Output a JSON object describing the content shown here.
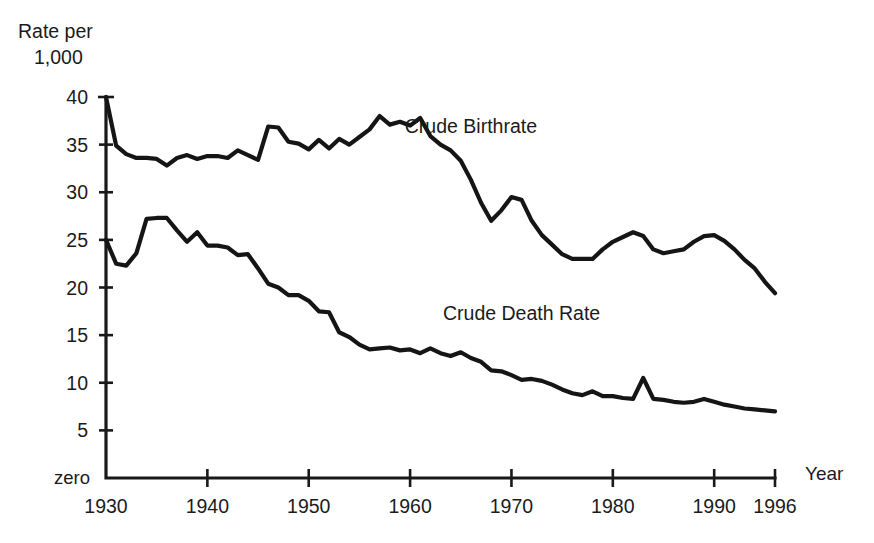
{
  "chart_data": {
    "type": "line",
    "title": "",
    "subtitle": "",
    "ylabel_line1": "Rate per",
    "ylabel_line2": "1,000",
    "xlabel": "Year",
    "zero_label": "zero",
    "grid": false,
    "legend_position": "inline-annotation",
    "xlim": [
      1930,
      1996
    ],
    "ylim": [
      0,
      40
    ],
    "yticks": [
      40,
      35,
      30,
      25,
      20,
      15,
      10,
      5
    ],
    "ytick_labels": [
      "40",
      "35",
      "30",
      "25",
      "20",
      "15",
      "10",
      "5"
    ],
    "xticks": [
      1930,
      1940,
      1950,
      1960,
      1970,
      1980,
      1990,
      1996
    ],
    "xtick_labels": [
      "1930",
      "1940",
      "1950",
      "1960",
      "1970",
      "1980",
      "1990",
      "1996"
    ],
    "x": [
      1930,
      1931,
      1932,
      1933,
      1934,
      1935,
      1936,
      1937,
      1938,
      1939,
      1940,
      1941,
      1942,
      1943,
      1944,
      1945,
      1946,
      1947,
      1948,
      1949,
      1950,
      1951,
      1952,
      1953,
      1954,
      1955,
      1956,
      1957,
      1958,
      1959,
      1960,
      1961,
      1962,
      1963,
      1964,
      1965,
      1966,
      1967,
      1968,
      1969,
      1970,
      1971,
      1972,
      1973,
      1974,
      1975,
      1976,
      1977,
      1978,
      1979,
      1980,
      1981,
      1982,
      1983,
      1984,
      1985,
      1986,
      1987,
      1988,
      1989,
      1990,
      1991,
      1992,
      1993,
      1994,
      1995,
      1996
    ],
    "series": [
      {
        "name": "Crude Birthrate",
        "label": "Crude Birthrate",
        "label_x": 1966,
        "label_y": 36.2,
        "color": "#151515",
        "values": [
          40.0,
          34.9,
          34.0,
          33.6,
          33.6,
          33.5,
          32.8,
          33.6,
          33.9,
          33.5,
          33.8,
          33.8,
          33.6,
          34.4,
          33.9,
          33.4,
          36.9,
          36.8,
          35.3,
          35.1,
          34.5,
          35.5,
          34.6,
          35.6,
          35.0,
          35.8,
          36.6,
          38.0,
          37.1,
          37.4,
          37.0,
          37.8,
          35.9,
          35.0,
          34.4,
          33.3,
          31.3,
          28.9,
          27.0,
          28.1,
          29.5,
          29.2,
          27.0,
          25.5,
          24.5,
          23.5,
          23.0,
          23.0,
          23.0,
          24.0,
          24.8,
          25.3,
          25.8,
          25.4,
          24.0,
          23.6,
          23.8,
          24.0,
          24.8,
          25.4,
          25.5,
          24.9,
          24.0,
          22.9,
          22.0,
          20.6,
          19.4
        ]
      },
      {
        "name": "Crude Death Rate",
        "label": "Crude Death Rate",
        "label_x": 1971,
        "label_y": 16.6,
        "color": "#151515",
        "values": [
          25.0,
          22.5,
          22.3,
          23.6,
          27.2,
          27.3,
          27.3,
          26.0,
          24.8,
          25.8,
          24.4,
          24.4,
          24.2,
          23.4,
          23.5,
          22.0,
          20.4,
          20.0,
          19.2,
          19.2,
          18.6,
          17.5,
          17.4,
          15.3,
          14.8,
          14.0,
          13.5,
          13.6,
          13.7,
          13.4,
          13.5,
          13.1,
          13.6,
          13.1,
          12.8,
          13.2,
          12.6,
          12.2,
          11.3,
          11.2,
          10.8,
          10.3,
          10.4,
          10.2,
          9.8,
          9.3,
          8.9,
          8.7,
          9.1,
          8.6,
          8.6,
          8.4,
          8.3,
          10.5,
          8.3,
          8.2,
          8.0,
          7.9,
          8.0,
          8.3,
          8.0,
          7.7,
          7.5,
          7.3,
          7.2,
          7.1,
          7.0
        ]
      }
    ]
  },
  "geometry": {
    "plot_left": 106,
    "plot_right": 775,
    "plot_top": 97,
    "plot_bottom": 478
  }
}
